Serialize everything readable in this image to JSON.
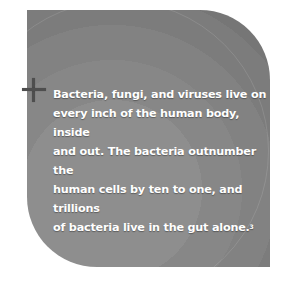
{
  "callout": {
    "lines": [
      "Bacteria, fungi, and viruses live on",
      "every inch of the human body, inside",
      "and out. The bacteria outnumber the",
      "human cells by ten to one, and trillions",
      "of bacteria live in the gut alone."
    ],
    "footnote": "3",
    "icon": "plus-icon",
    "colors": {
      "background": "#8a8a8a",
      "text": "#ffffff",
      "plus": "#4e4e4e"
    }
  }
}
